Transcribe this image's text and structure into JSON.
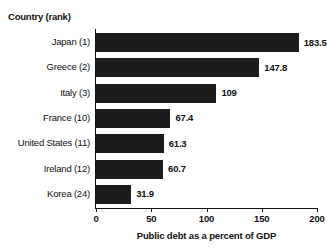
{
  "chart_data": {
    "type": "bar",
    "orientation": "horizontal",
    "title": "",
    "xlabel": "Public debt as a percent of GDP",
    "ylabel": "Country (rank)",
    "categories": [
      "Japan (1)",
      "Greece (2)",
      "Italy (3)",
      "France (10)",
      "United States (11)",
      "Ireland (12)",
      "Korea (24)"
    ],
    "values": [
      183.5,
      147.8,
      109,
      67.4,
      61.3,
      60.7,
      31.9
    ],
    "value_labels": [
      "183.5",
      "147.8",
      "109",
      "67.4",
      "61.3",
      "60.7",
      "31.9"
    ],
    "xlim": [
      0,
      200
    ],
    "xticks": [
      0,
      50,
      100,
      150,
      200
    ],
    "xtick_labels": [
      "0",
      "50",
      "100",
      "150",
      "200"
    ],
    "grid": false,
    "legend": false,
    "bar_color": "#1c1c1c",
    "axis_color": "#111111",
    "background_color": "#ffffff"
  }
}
